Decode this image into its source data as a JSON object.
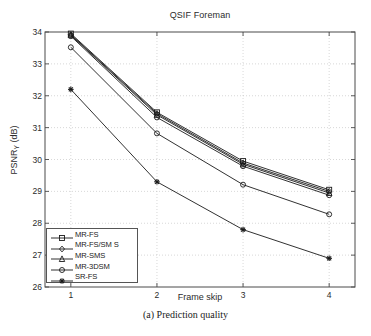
{
  "figure": {
    "caption": "(a) Prediction quality"
  },
  "chart_data": {
    "type": "line",
    "title": "QSIF Foreman",
    "xlabel": "Frame skip",
    "ylabel": "PSNR_Y (dB)",
    "ylabel_main": "PSNR",
    "ylabel_sub": "Y",
    "ylabel_unit": " (dB)",
    "x": [
      1,
      2,
      3,
      4
    ],
    "xtick_labels": [
      "1",
      "2",
      "3",
      "4"
    ],
    "ytick_labels": [
      "26",
      "27",
      "28",
      "29",
      "30",
      "31",
      "32",
      "33",
      "34"
    ],
    "xlim": [
      0.7,
      4.3
    ],
    "ylim": [
      26,
      34
    ],
    "grid": true,
    "legend_position": "lower-left",
    "series": [
      {
        "name": "MR-FS",
        "marker": "square",
        "color": "#1a1a1a",
        "values": [
          33.95,
          31.48,
          29.95,
          29.05
        ]
      },
      {
        "name": "MR-FS/SM S",
        "marker": "diamond",
        "color": "#1a1a1a",
        "values": [
          33.92,
          31.44,
          29.89,
          29.0
        ]
      },
      {
        "name": "MR-SMS",
        "marker": "triangle",
        "color": "#1a1a1a",
        "values": [
          33.9,
          31.4,
          29.85,
          28.95
        ]
      },
      {
        "name": "MR-3DSM",
        "marker": "circle",
        "color": "#1a1a1a",
        "values": [
          33.87,
          31.32,
          29.79,
          28.88
        ]
      },
      {
        "name": "SR-FS",
        "marker": "star",
        "color": "#1a1a1a",
        "values": [
          32.2,
          29.3,
          27.8,
          26.9
        ]
      }
    ],
    "extra_series": [
      {
        "name": "MR-3DSM-low",
        "marker": "circle",
        "color": "#1a1a1a",
        "values": [
          33.52,
          30.82,
          29.21,
          28.28
        ]
      }
    ]
  }
}
